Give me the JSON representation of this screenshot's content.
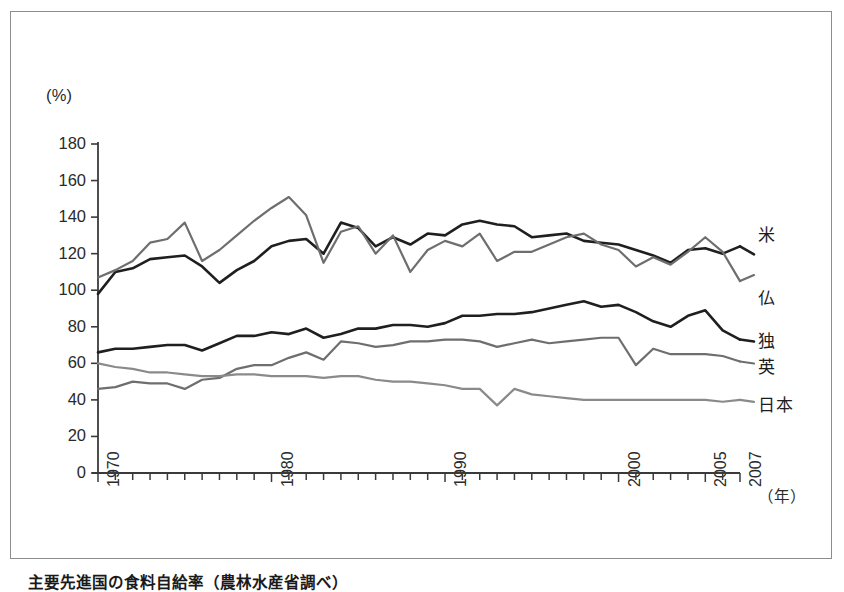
{
  "figure": {
    "caption": "主要先進国の食料自給率（農林水産省調べ）",
    "y_unit": "(%)",
    "x_unit": "（年）"
  },
  "chart_data": {
    "type": "line",
    "title": "主要先進国の食料自給率（農林水産省調べ）",
    "xlabel": "（年）",
    "ylabel": "(%)",
    "xlim": [
      1970,
      2007
    ],
    "ylim": [
      0,
      180
    ],
    "grid": false,
    "legend_position": "right-of-plot",
    "y_ticks": [
      0,
      20,
      40,
      60,
      80,
      100,
      120,
      140,
      160,
      180
    ],
    "x_ticks_labeled": [
      1970,
      1980,
      1990,
      2000,
      2005,
      2007
    ],
    "x_minor_tick_interval": 1,
    "x": [
      1970,
      1971,
      1972,
      1973,
      1974,
      1975,
      1976,
      1977,
      1978,
      1979,
      1980,
      1981,
      1982,
      1983,
      1984,
      1985,
      1986,
      1987,
      1988,
      1989,
      1990,
      1991,
      1992,
      1993,
      1994,
      1995,
      1996,
      1997,
      1998,
      1999,
      2000,
      2001,
      2002,
      2003,
      2004,
      2005,
      2006,
      2007
    ],
    "series": [
      {
        "name": "米",
        "name_en": "United States",
        "color": "#1f1f1f",
        "width": 2.6,
        "values": [
          98,
          110,
          112,
          117,
          118,
          119,
          113,
          104,
          111,
          116,
          124,
          127,
          128,
          120,
          137,
          134,
          124,
          129,
          125,
          131,
          130,
          136,
          138,
          136,
          135,
          129,
          130,
          131,
          127,
          126,
          125,
          122,
          119,
          115,
          122,
          123,
          120,
          124
        ],
        "endpoint_value": 124
      },
      {
        "name": "仏",
        "name_en": "France",
        "color": "#6e6e6e",
        "width": 2.2,
        "values": [
          107,
          111,
          116,
          126,
          128,
          137,
          116,
          122,
          130,
          138,
          145,
          151,
          141,
          115,
          132,
          135,
          120,
          130,
          110,
          122,
          127,
          124,
          131,
          116,
          121,
          121,
          125,
          129,
          131,
          125,
          122,
          113,
          118,
          114,
          121,
          129,
          121,
          105
        ],
        "endpoint_value": 105
      },
      {
        "name": "独",
        "name_en": "Germany",
        "color": "#1f1f1f",
        "width": 2.6,
        "values": [
          66,
          68,
          68,
          69,
          70,
          70,
          67,
          71,
          75,
          75,
          77,
          76,
          79,
          74,
          76,
          79,
          79,
          81,
          81,
          80,
          82,
          86,
          86,
          87,
          87,
          88,
          90,
          92,
          94,
          91,
          92,
          88,
          83,
          80,
          86,
          89,
          78,
          73
        ],
        "endpoint_value": 73
      },
      {
        "name": "英",
        "name_en": "United Kingdom",
        "color": "#6e6e6e",
        "width": 2.2,
        "values": [
          46,
          47,
          50,
          49,
          49,
          46,
          51,
          52,
          57,
          59,
          59,
          63,
          66,
          62,
          72,
          71,
          69,
          70,
          72,
          72,
          73,
          73,
          72,
          69,
          71,
          73,
          71,
          72,
          73,
          74,
          74,
          59,
          68,
          65,
          65,
          65,
          64,
          61
        ],
        "endpoint_value": 61
      },
      {
        "name": "日本",
        "name_en": "Japan",
        "color": "#8a8a8a",
        "width": 2.2,
        "values": [
          60,
          58,
          57,
          55,
          55,
          54,
          53,
          53,
          54,
          54,
          53,
          53,
          53,
          52,
          53,
          53,
          51,
          50,
          50,
          49,
          48,
          46,
          46,
          37,
          46,
          43,
          42,
          41,
          40,
          40,
          40,
          40,
          40,
          40,
          40,
          40,
          39,
          40
        ],
        "endpoint_value": 40
      }
    ]
  },
  "labels": {
    "y_ticks": [
      "180",
      "160",
      "140",
      "120",
      "100",
      "80",
      "60",
      "40",
      "20",
      "0"
    ],
    "x_ticks": [
      "1970",
      "1980",
      "1990",
      "2000",
      "2005",
      "2007"
    ],
    "series": [
      "米",
      "仏",
      "独",
      "英",
      "日本"
    ]
  }
}
